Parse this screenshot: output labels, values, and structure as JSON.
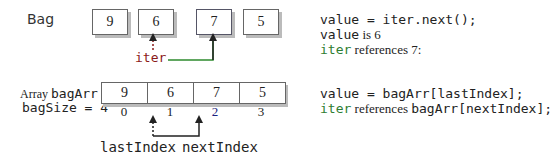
{
  "bag": {
    "label": "Bag",
    "items": [
      "9",
      "6",
      "7",
      "5"
    ],
    "iterator_label": "iter"
  },
  "bag_notes": {
    "line1_code": "value = iter.next();",
    "line2_code": "value",
    "line2_text": " is 6",
    "line3_code": "iter",
    "line3_text": " references 7:"
  },
  "array": {
    "label_prefix": "Array ",
    "label_name": "bagArr",
    "size_label": "bagSize = 4",
    "cells": [
      "9",
      "6",
      "7",
      "5"
    ],
    "indices": [
      "0",
      "1",
      "2",
      "3"
    ],
    "last_index_label": "lastIndex",
    "next_index_label": "nextIndex"
  },
  "array_notes": {
    "line1_code": "value = bagArr[lastIndex];",
    "line2_code": "iter",
    "line2_text": " references ",
    "line2_code2": "bagArr[nextIndex];"
  },
  "colors": {
    "iter_label": "#8b1a1a",
    "iter_line": "#2e8b2e",
    "code_accent": "#2e7d32",
    "index_accent": "#1a237e",
    "box_shadow": "#bbbbbb"
  }
}
